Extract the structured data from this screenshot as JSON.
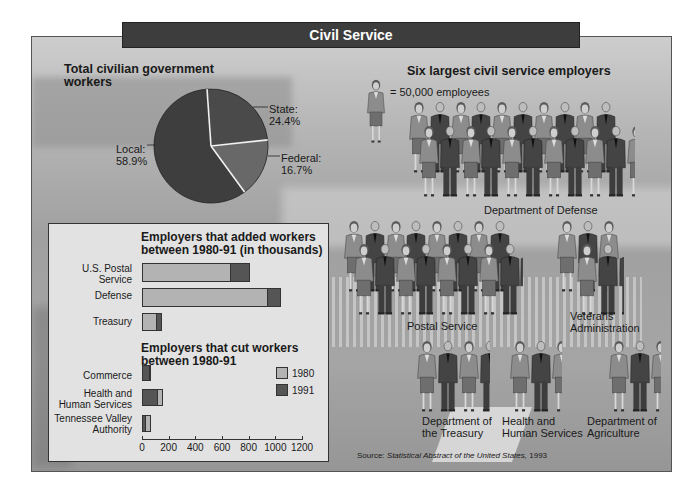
{
  "title": "Civil Service",
  "pie": {
    "title_line1": "Total civilian government",
    "title_line2": "workers",
    "slices": [
      {
        "name": "State",
        "label_line1": "State:",
        "label_line2": "24.4%",
        "value": 24.4,
        "color": "#4a4a4a"
      },
      {
        "name": "Federal",
        "label_line1": "Federal:",
        "label_line2": "16.7%",
        "value": 16.7,
        "color": "#686868"
      },
      {
        "name": "Local",
        "label_line1": "Local:",
        "label_line2": "58.9%",
        "value": 58.9,
        "color": "#3e3e3e"
      }
    ]
  },
  "employers": {
    "title": "Six largest civil service employers",
    "legend_text": "= 50,000 employees",
    "groups": [
      {
        "label_line1": "Department of Defense",
        "label_line2": "",
        "figures": 20.3
      },
      {
        "label_line1": "Postal Service",
        "label_line2": "",
        "figures": 16.1
      },
      {
        "label_line1": "Veterans",
        "label_line2": "Administration",
        "figures": 5.2
      },
      {
        "label_line1": "Department of",
        "label_line2": "the Treasury",
        "figures": 3.5
      },
      {
        "label_line1": "Health and",
        "label_line2": "Human Services",
        "figures": 2.5
      },
      {
        "label_line1": "Department of",
        "label_line2": "Agriculture",
        "figures": 2.5
      }
    ]
  },
  "bar_panel": {
    "added_title_line1": "Employers that added workers",
    "added_title_line2": "between 1980-91 (in thousands)",
    "cut_title_line1": "Employers that cut workers",
    "cut_title_line2": "between 1980-91",
    "legend": [
      {
        "label": "1980",
        "color": "#b3b3b3"
      },
      {
        "label": "1991",
        "color": "#555555"
      }
    ],
    "ticks": [
      "0",
      "200",
      "400",
      "600",
      "800",
      "1000",
      "1200"
    ],
    "added": [
      {
        "label_line1": "U.S. Postal",
        "label_line2": "Service",
        "v1980": 667,
        "v1991": 810
      },
      {
        "label_line1": "Defense",
        "label_line2": "",
        "v1980": 945,
        "v1991": 1043
      },
      {
        "label_line1": "Treasury",
        "label_line2": "",
        "v1980": 112,
        "v1991": 150
      }
    ],
    "cut": [
      {
        "label_line1": "Commerce",
        "label_line2": "",
        "v1980": 70,
        "v1991": 62
      },
      {
        "label_line1": "Health and",
        "label_line2": "Human Services",
        "v1980": 158,
        "v1991": 120
      },
      {
        "label_line1": "Tennessee Valley",
        "label_line2": "Authority",
        "v1980": 68,
        "v1991": 30
      }
    ]
  },
  "source": {
    "prefix": "Source: ",
    "work": "Statistical Abstract of the United States,",
    "year": " 1993"
  },
  "chart_data": [
    {
      "type": "pie",
      "title": "Total civilian government workers",
      "categories": [
        "State",
        "Federal",
        "Local"
      ],
      "values": [
        24.4,
        16.7,
        58.9
      ],
      "unit": "%"
    },
    {
      "type": "bar",
      "orientation": "horizontal",
      "title": "Employers that added workers between 1980-91 (in thousands)",
      "categories": [
        "U.S. Postal Service",
        "Defense",
        "Treasury"
      ],
      "series": [
        {
          "name": "1980",
          "values": [
            667,
            945,
            112
          ]
        },
        {
          "name": "1991",
          "values": [
            810,
            1043,
            150
          ]
        }
      ],
      "xlim": [
        0,
        1200
      ],
      "xticks": [
        0,
        200,
        400,
        600,
        800,
        1000,
        1200
      ],
      "legend_position": "right"
    },
    {
      "type": "bar",
      "orientation": "horizontal",
      "title": "Employers that cut workers between 1980-91",
      "categories": [
        "Commerce",
        "Health and Human Services",
        "Tennessee Valley Authority"
      ],
      "series": [
        {
          "name": "1980",
          "values": [
            70,
            158,
            68
          ]
        },
        {
          "name": "1991",
          "values": [
            62,
            120,
            30
          ]
        }
      ],
      "xlim": [
        0,
        1200
      ],
      "xticks": [
        0,
        200,
        400,
        600,
        800,
        1000,
        1200
      ]
    },
    {
      "type": "pictograph",
      "title": "Six largest civil service employers",
      "unit": "1 figure = 50,000 employees",
      "categories": [
        "Department of Defense",
        "Postal Service",
        "Veterans Administration",
        "Department of the Treasury",
        "Health and Human Services",
        "Department of Agriculture"
      ],
      "values_figures": [
        20.3,
        16.1,
        5.2,
        3.5,
        2.5,
        2.5
      ],
      "values_employees": [
        1015000,
        805000,
        260000,
        175000,
        125000,
        125000
      ]
    }
  ]
}
